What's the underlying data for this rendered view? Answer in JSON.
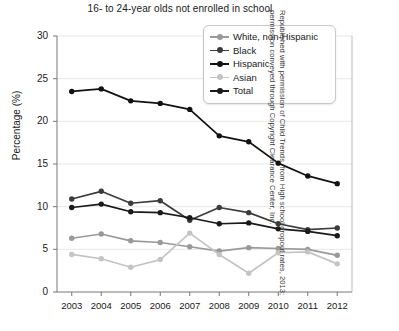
{
  "chart_data": {
    "type": "line",
    "title": "16- to 24-year olds not enrolled in school",
    "xlabel": "",
    "ylabel": "Percentage (%)",
    "x": [
      2003,
      2004,
      2005,
      2006,
      2007,
      2008,
      2009,
      2010,
      2011,
      2012
    ],
    "xtick_labels": [
      "2003",
      "2004",
      "2005",
      "2006",
      "2007",
      "2008",
      "2009",
      "2010",
      "2011",
      "2012"
    ],
    "ytick_labels": [
      "0",
      "5",
      "10",
      "15",
      "20",
      "25",
      "30"
    ],
    "yticks": [
      0,
      5,
      10,
      15,
      20,
      25,
      30
    ],
    "ylim": [
      0,
      30
    ],
    "grid": "horizontal",
    "legend_position": "top-right",
    "series": [
      {
        "name": "White, non-Hispanic",
        "color": "#999999",
        "values": [
          6.3,
          6.8,
          6.0,
          5.8,
          5.3,
          4.8,
          5.2,
          5.1,
          5.0,
          4.3
        ]
      },
      {
        "name": "Black",
        "color": "#3c3c3c",
        "values": [
          10.9,
          11.8,
          10.4,
          10.7,
          8.4,
          9.9,
          9.3,
          8.0,
          7.3,
          7.5
        ]
      },
      {
        "name": "Hispanic",
        "color": "#111111",
        "values": [
          23.5,
          23.8,
          22.4,
          22.1,
          21.4,
          18.3,
          17.6,
          15.1,
          13.6,
          12.7
        ]
      },
      {
        "name": "Asian",
        "color": "#c4c4c4",
        "values": [
          4.4,
          3.9,
          2.9,
          3.8,
          6.9,
          4.4,
          2.2,
          4.6,
          4.7,
          3.3
        ]
      },
      {
        "name": "Total",
        "color": "#1a1a1a",
        "values": [
          9.9,
          10.3,
          9.4,
          9.3,
          8.7,
          8.0,
          8.1,
          7.4,
          7.1,
          6.6
        ]
      }
    ]
  },
  "credit": {
    "text": "Republished with permission of Child Trends, from High school dropout rates, 2013; permission conveyed through Copyright Clearance Center, Inc."
  }
}
